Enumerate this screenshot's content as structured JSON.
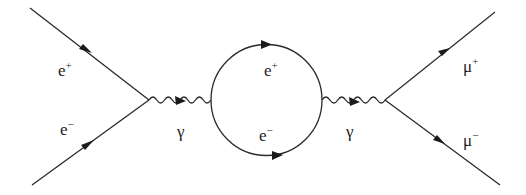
{
  "diagram": {
    "type": "feynman",
    "process": "e+ e- -> gamma -> (e+ e- loop) -> gamma -> mu+ mu-",
    "incoming": [
      {
        "particle": "e",
        "charge": "+",
        "label": "e",
        "sup": "+"
      },
      {
        "particle": "e",
        "charge": "-",
        "label": "e",
        "sup": "−"
      }
    ],
    "propagators": [
      {
        "particle": "photon",
        "label": "γ"
      },
      {
        "particle": "photon",
        "label": "γ"
      }
    ],
    "loop": [
      {
        "particle": "e",
        "charge": "+",
        "label": "e",
        "sup": "+"
      },
      {
        "particle": "e",
        "charge": "-",
        "label": "e",
        "sup": "−"
      }
    ],
    "outgoing": [
      {
        "particle": "mu",
        "charge": "+",
        "label": "μ",
        "sup": "+"
      },
      {
        "particle": "mu",
        "charge": "-",
        "label": "μ",
        "sup": "−"
      }
    ],
    "colors": {
      "line": "#2a2a2a",
      "background": "#ffffff"
    }
  }
}
